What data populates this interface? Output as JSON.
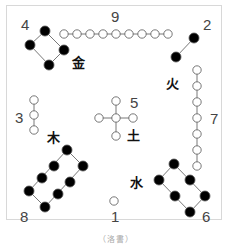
{
  "diagram": {
    "caption": "（洛書）",
    "numbers": {
      "n1": "1",
      "n2": "2",
      "n3": "3",
      "n4": "4",
      "n5": "5",
      "n6": "6",
      "n7": "7",
      "n8": "8",
      "n9": "9"
    },
    "elements": {
      "metal": "金",
      "fire": "火",
      "wood": "木",
      "earth": "土",
      "water": "水"
    },
    "groups": [
      {
        "number": 1,
        "position": "bottom",
        "dots": 1,
        "type": "yang-white"
      },
      {
        "number": 2,
        "position": "top-right",
        "dots": 2,
        "type": "yin-black"
      },
      {
        "number": 3,
        "position": "left",
        "dots": 3,
        "type": "yang-white"
      },
      {
        "number": 4,
        "position": "top-left",
        "dots": 4,
        "type": "yin-black"
      },
      {
        "number": 5,
        "position": "center",
        "dots": 5,
        "type": "yang-white"
      },
      {
        "number": 6,
        "position": "bottom-right",
        "dots": 6,
        "type": "yin-black"
      },
      {
        "number": 7,
        "position": "right",
        "dots": 7,
        "type": "yang-white"
      },
      {
        "number": 8,
        "position": "bottom-left",
        "dots": 8,
        "type": "yin-black"
      },
      {
        "number": 9,
        "position": "top",
        "dots": 9,
        "type": "yang-white"
      }
    ],
    "colors": {
      "white_dot_stroke": "#555555",
      "black_dot": "#000000",
      "line": "#555555",
      "frame": "#d8d8d8"
    }
  }
}
